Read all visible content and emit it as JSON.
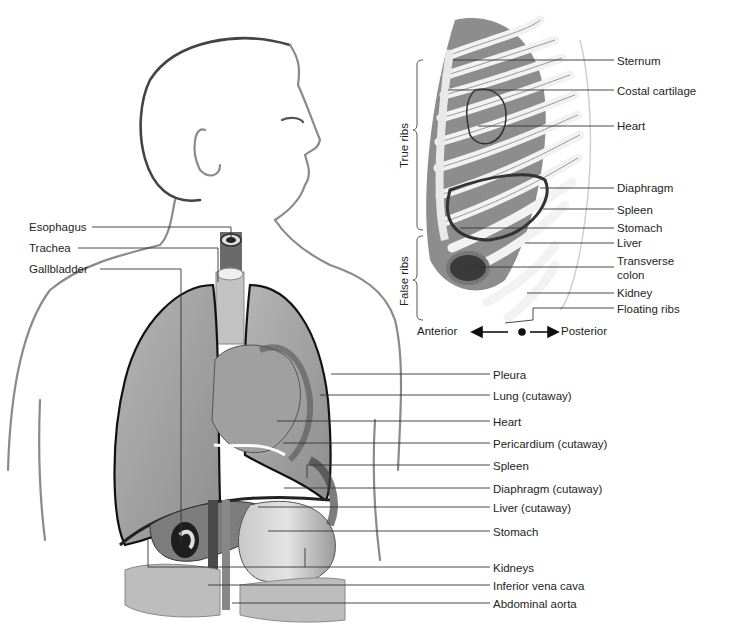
{
  "figure": {
    "main_view": {
      "left_labels": [
        {
          "label": "Esophagus",
          "x": 29,
          "y": 221
        },
        {
          "label": "Trachea",
          "x": 29,
          "y": 242
        },
        {
          "label": "Gallbladder",
          "x": 29,
          "y": 263
        }
      ],
      "right_labels": [
        {
          "label": "Pleura",
          "x": 493,
          "y": 369
        },
        {
          "label": "Lung (cutaway)",
          "x": 493,
          "y": 390
        },
        {
          "label": "Heart",
          "x": 493,
          "y": 416
        },
        {
          "label": "Pericardium (cutaway)",
          "x": 493,
          "y": 438
        },
        {
          "label": "Spleen",
          "x": 493,
          "y": 460
        },
        {
          "label": "Diaphragm (cutaway)",
          "x": 493,
          "y": 483
        },
        {
          "label": "Liver (cutaway)",
          "x": 493,
          "y": 502
        },
        {
          "label": "Stomach",
          "x": 493,
          "y": 526
        },
        {
          "label": "Kidneys",
          "x": 493,
          "y": 562
        },
        {
          "label": "Inferior vena cava",
          "x": 493,
          "y": 580
        },
        {
          "label": "Abdominal aorta",
          "x": 493,
          "y": 598
        }
      ]
    },
    "ribcage_view": {
      "labels": [
        {
          "label": "Sternum",
          "x": 617,
          "y": 55
        },
        {
          "label": "Costal cartilage",
          "x": 617,
          "y": 85
        },
        {
          "label": "Heart",
          "x": 617,
          "y": 120
        },
        {
          "label": "Diaphragm",
          "x": 617,
          "y": 182
        },
        {
          "label": "Spleen",
          "x": 617,
          "y": 204
        },
        {
          "label": "Stomach",
          "x": 617,
          "y": 222
        },
        {
          "label": "Liver",
          "x": 617,
          "y": 237
        },
        {
          "label": "Transverse",
          "x": 617,
          "y": 255
        },
        {
          "label": "colon",
          "x": 617,
          "y": 269
        },
        {
          "label": "Kidney",
          "x": 617,
          "y": 287
        },
        {
          "label": "Floating ribs",
          "x": 617,
          "y": 303
        }
      ],
      "brackets": [
        {
          "label": "True ribs",
          "x": 399,
          "y": 200
        },
        {
          "label": "False ribs",
          "x": 399,
          "y": 282
        }
      ],
      "orientation": {
        "anterior": "Anterior",
        "posterior": "Posterior"
      }
    }
  }
}
